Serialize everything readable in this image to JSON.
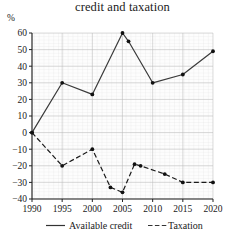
{
  "chart_data": {
    "type": "line",
    "title": "credit and taxation",
    "xlabel": "",
    "ylabel": "%",
    "ylim": [
      -40,
      60
    ],
    "xlim": [
      1990,
      2020
    ],
    "grid": true,
    "legend_position": "bottom",
    "yticks": [
      60,
      50,
      40,
      30,
      20,
      10,
      0,
      -10,
      -20,
      -30,
      -40
    ],
    "ytick_labels": [
      "60",
      "50",
      "40",
      "30",
      "20",
      "10",
      "0",
      "−10",
      "−20",
      "−30",
      "−40"
    ],
    "xticks": [
      1990,
      1995,
      2000,
      2005,
      2010,
      2015,
      2020
    ],
    "xtick_labels": [
      "1990",
      "1995",
      "2000",
      "2005",
      "2010",
      "2015",
      "2020"
    ],
    "series": [
      {
        "name": "Available credit",
        "style": "solid",
        "color": "#3a3a3a",
        "marker": "dot",
        "x": [
          1990,
          1995,
          2000,
          2005,
          2006,
          2010,
          2015,
          2020
        ],
        "values": [
          0,
          30,
          23,
          60,
          55,
          30,
          35,
          49
        ]
      },
      {
        "name": "Taxation",
        "style": "dashed",
        "color": "#1a1a1a",
        "marker": "dot",
        "x": [
          1990,
          1995,
          2000,
          2003,
          2005,
          2007,
          2008,
          2012,
          2015,
          2020
        ],
        "values": [
          0,
          -20,
          -10,
          -33,
          -36,
          -19,
          -20,
          -25,
          -30,
          -30
        ]
      }
    ]
  },
  "legend": {
    "items": [
      {
        "label": "Available credit",
        "style": "solid"
      },
      {
        "label": "Taxation",
        "style": "dashed"
      }
    ]
  }
}
